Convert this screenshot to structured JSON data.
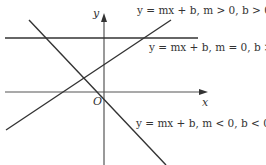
{
  "diagram": {
    "type": "coordinate-plane-lines",
    "axes": {
      "x_label": "x",
      "y_label": "y",
      "origin_label": "O"
    },
    "lines": [
      {
        "id": "positive-slope",
        "label": "y = mx + b, m > 0, b > 0",
        "slope_sign": "positive",
        "intercept_sign": "positive"
      },
      {
        "id": "zero-slope",
        "label": "y = mx + b, m = 0, b > 0",
        "slope_sign": "zero",
        "intercept_sign": "positive"
      },
      {
        "id": "negative-slope",
        "label": "y = mx + b, m < 0, b < 0",
        "slope_sign": "negative",
        "intercept_sign": "negative"
      }
    ],
    "colors": {
      "line": "#333333",
      "axis": "#555555",
      "background": "#ffffff"
    }
  }
}
